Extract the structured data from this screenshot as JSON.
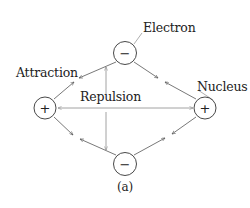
{
  "diagram": {
    "labels": {
      "electron": "Electron",
      "nucleus": "Nucleus",
      "attraction": "Attraction",
      "repulsion": "Repulsion",
      "caption": "(a)"
    },
    "nodes": [
      {
        "id": "electron-top",
        "type": "electron",
        "sign": "−",
        "cx": 125,
        "cy": 53
      },
      {
        "id": "nucleus-left",
        "type": "nucleus",
        "sign": "+",
        "cx": 45,
        "cy": 108
      },
      {
        "id": "nucleus-right",
        "type": "nucleus",
        "sign": "+",
        "cx": 205,
        "cy": 108
      },
      {
        "id": "electron-bottom",
        "type": "electron",
        "sign": "−",
        "cx": 125,
        "cy": 164
      }
    ],
    "edges": [
      {
        "from": "electron-top",
        "to": "nucleus-left",
        "kind": "attraction"
      },
      {
        "from": "electron-top",
        "to": "nucleus-right",
        "kind": "attraction"
      },
      {
        "from": "electron-bottom",
        "to": "nucleus-left",
        "kind": "attraction"
      },
      {
        "from": "electron-bottom",
        "to": "nucleus-right",
        "kind": "attraction"
      },
      {
        "from": "electron-top",
        "to": "electron-bottom",
        "kind": "repulsion"
      },
      {
        "from": "nucleus-left",
        "to": "nucleus-right",
        "kind": "repulsion"
      }
    ],
    "colors": {
      "text": "#222222",
      "circle_stroke": "#333333",
      "arrow": "#555555",
      "repulsion_arrow": "#8a8a8a",
      "leader_line": "#999999"
    }
  }
}
